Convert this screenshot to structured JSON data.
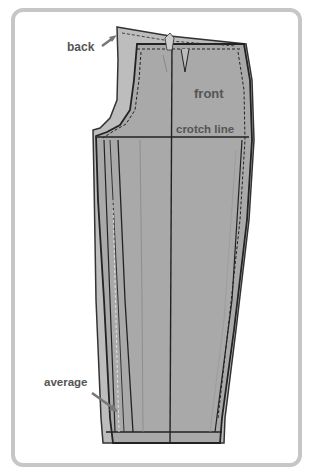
{
  "diagram": {
    "labels": {
      "back": "back",
      "front": "front",
      "crotch_line": "crotch line",
      "average": "average"
    },
    "colors": {
      "frame": "#c6c6c6",
      "back_piece": "#bdbdbd",
      "front_piece": "#a9a9a9",
      "outline": "#222222",
      "label_text": "#555555"
    }
  }
}
